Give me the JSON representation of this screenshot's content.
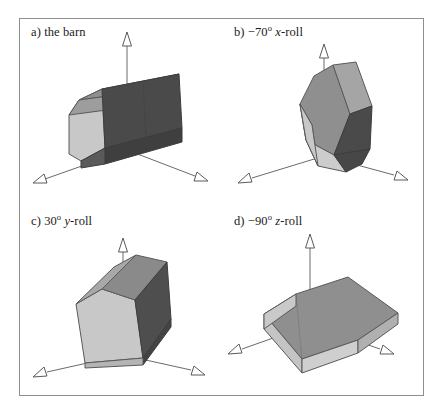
{
  "figure": {
    "type": "line-drawing-figure",
    "background_color": "#ffffff",
    "frame_border_color": "#8e8e8e",
    "panel_count": 4,
    "palette": {
      "face_light": "#c8c8c8",
      "face_medium": "#8f8f8f",
      "face_dark": "#4a4a4a",
      "edge": "#5a5a5a",
      "axis_line": "#6b6b6b",
      "arrow_fill": "#ffffff",
      "text": "#1a1a1a"
    },
    "panels": [
      {
        "id": "a",
        "marker": "a)",
        "caption_plain": "the barn",
        "caption_angle": "",
        "caption_degree": "",
        "caption_axis": "",
        "full_label": "a) the barn"
      },
      {
        "id": "b",
        "marker": "b)",
        "caption_plain": "",
        "caption_angle": "−70",
        "caption_degree": "o",
        "caption_axis": "x",
        "caption_suffix": "-roll",
        "full_label": "b) −70o x-roll"
      },
      {
        "id": "c",
        "marker": "c)",
        "caption_plain": "",
        "caption_angle": "30",
        "caption_degree": "o",
        "caption_axis": "y",
        "caption_suffix": "-roll",
        "full_label": "c) 30o y-roll"
      },
      {
        "id": "d",
        "marker": "d)",
        "caption_plain": "",
        "caption_angle": "−90",
        "caption_degree": "o",
        "caption_axis": "z",
        "caption_suffix": "-roll",
        "full_label": "d) −90o z-roll"
      }
    ],
    "axes": {
      "count_per_panel": 3,
      "style": "thin line with open triangular arrowhead",
      "directions": [
        "up",
        "lower-left",
        "lower-right"
      ]
    }
  }
}
